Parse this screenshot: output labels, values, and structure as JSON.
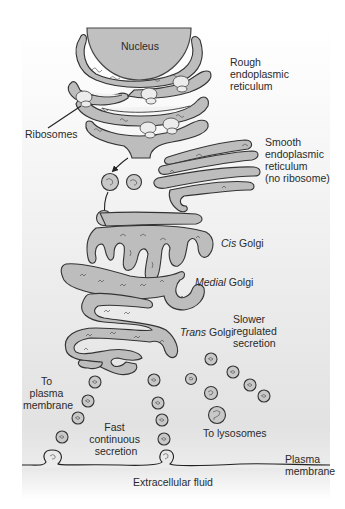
{
  "diagram": {
    "background": {
      "panel_top": "#ffffff",
      "panel_bottom": "#e4e4e4"
    },
    "colors": {
      "organelle_fill": "#bdbdbd",
      "outline": "#333333",
      "text": "#2a2a2a",
      "ribosome_fill": "#ececec"
    },
    "labels": {
      "nucleus": "Nucleus",
      "rough_er": [
        "Rough",
        "endoplasmic",
        "reticulum"
      ],
      "ribosomes": "Ribosomes",
      "smooth_er": [
        "Smooth",
        "endoplasmic",
        "reticulum",
        "(no ribosome)"
      ],
      "cis_golgi": {
        "italic": "Cis",
        "rest": " Golgi"
      },
      "medial_golgi": {
        "italic": "Medial",
        "rest": " Golgi"
      },
      "trans_golgi": {
        "italic": "Trans",
        "rest": " Golgi"
      },
      "slower_secretion": [
        "Slower",
        "regulated",
        "secretion"
      ],
      "to_plasma_membrane": [
        "To",
        "plasma",
        "membrane"
      ],
      "fast_secretion": [
        "Fast",
        "continuous",
        "secretion"
      ],
      "to_lysosomes": "To lysosomes",
      "plasma_membrane": [
        "Plasma",
        "membrane"
      ],
      "extracellular_fluid": "Extracellular fluid"
    },
    "structures": [
      "Nucleus",
      "Rough endoplasmic reticulum with ribosomes",
      "Smooth endoplasmic reticulum",
      "Transport vesicles",
      "Cis Golgi",
      "Medial Golgi",
      "Trans Golgi",
      "Secretory vesicles",
      "Lysosome-bound vesicles",
      "Plasma membrane with exocytosis"
    ]
  }
}
